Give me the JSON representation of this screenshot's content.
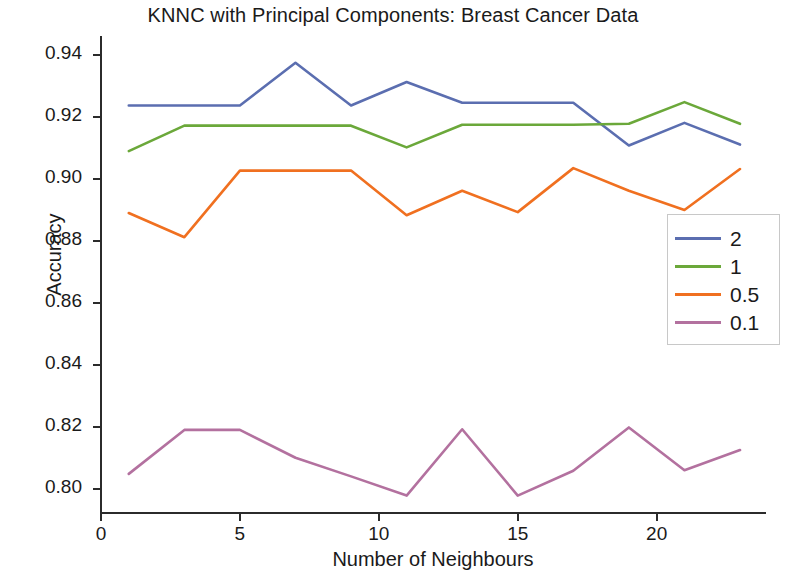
{
  "chart_data": {
    "type": "line",
    "title": "KNNC with Principal Components: Breast Cancer Data",
    "xlabel": "Number of Neighbours",
    "ylabel": "Accuracy",
    "x": [
      1,
      3,
      5,
      7,
      9,
      11,
      13,
      15,
      17,
      19,
      21,
      23
    ],
    "xlim": [
      0,
      23.9
    ],
    "ylim": [
      0.7925,
      0.9455
    ],
    "xticks": [
      0,
      5,
      10,
      15,
      20
    ],
    "xtick_labels": [
      "0",
      "5",
      "10",
      "15",
      "20"
    ],
    "yticks": [
      0.8,
      0.82,
      0.84,
      0.86,
      0.88,
      0.9,
      0.92,
      0.94
    ],
    "ytick_labels": [
      "0.80",
      "0.82",
      "0.84",
      "0.86",
      "0.88",
      "0.90",
      "0.92",
      "0.94"
    ],
    "grid": false,
    "legend_position": "center right",
    "legend_title": "",
    "series": [
      {
        "name": "2",
        "color": "#5b6eb0",
        "values": [
          0.9237,
          0.9237,
          0.9237,
          0.9375,
          0.9237,
          0.9313,
          0.9246,
          0.9246,
          0.9246,
          0.9108,
          0.9181,
          0.9111
        ]
      },
      {
        "name": "1",
        "color": "#6ba83a",
        "values": [
          0.909,
          0.9172,
          0.9172,
          0.9172,
          0.9172,
          0.9102,
          0.9175,
          0.9175,
          0.9175,
          0.9178,
          0.9248,
          0.9178
        ]
      },
      {
        "name": "0.5",
        "color": "#f07020",
        "values": [
          0.889,
          0.8812,
          0.9027,
          0.9027,
          0.9027,
          0.8883,
          0.8962,
          0.8893,
          0.9035,
          0.8962,
          0.89,
          0.9032
        ]
      },
      {
        "name": "0.1",
        "color": "#b3719f",
        "values": [
          0.8048,
          0.819,
          0.819,
          0.81,
          0.804,
          0.7978,
          0.8192,
          0.7978,
          0.8058,
          0.8198,
          0.806,
          0.8125
        ]
      }
    ]
  }
}
